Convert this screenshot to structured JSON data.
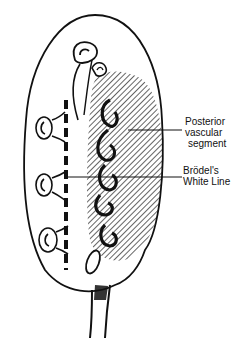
{
  "diagram": {
    "labels": [
      {
        "id": "posterior",
        "line1": "Posterior",
        "line2": "vascular",
        "line3": "segment"
      },
      {
        "id": "brodel",
        "line1": "Brödel's",
        "line2": "White Line"
      }
    ],
    "colors": {
      "ink": "#111111",
      "background": "#ffffff"
    }
  }
}
